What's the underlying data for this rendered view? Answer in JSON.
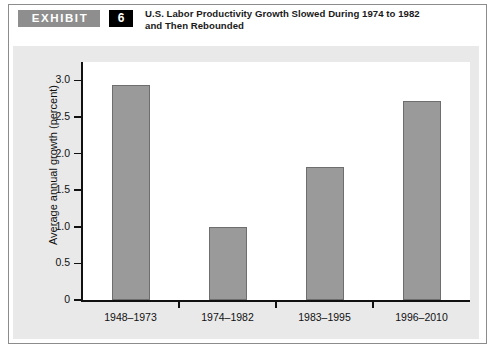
{
  "exhibit": {
    "tag_label": "EXHIBIT",
    "number": "6",
    "title_line1": "U.S. Labor Productivity Growth Slowed During 1974 to 1982",
    "title_line2": "and Then Rebounded"
  },
  "colors": {
    "bar_fill": "#9a9a9a",
    "bar_edge": "#6e6e6e",
    "panel_background": "#e9e9e9",
    "plot_background": "#ffffff",
    "axis": "#111111",
    "tag_background": "#8e8e8e",
    "number_background": "#000000"
  },
  "chart_data": {
    "type": "bar",
    "title": "U.S. Labor Productivity Growth Slowed During 1974 to 1982 and Then Rebounded",
    "xlabel": "",
    "ylabel": "Average annual growth (percent)",
    "categories": [
      "1948–1973",
      "1974–1982",
      "1983–1995",
      "1996–2010"
    ],
    "values": [
      2.93,
      1.0,
      1.81,
      2.72
    ],
    "ylim": [
      0,
      3.25
    ],
    "yticks": [
      0,
      0.5,
      1.0,
      1.5,
      2.0,
      2.5,
      3.0
    ],
    "ytick_labels": [
      "0",
      "0.5",
      "1.0",
      "1.5",
      "2.0",
      "2.5",
      "3.0"
    ],
    "grid": false,
    "legend": false
  }
}
